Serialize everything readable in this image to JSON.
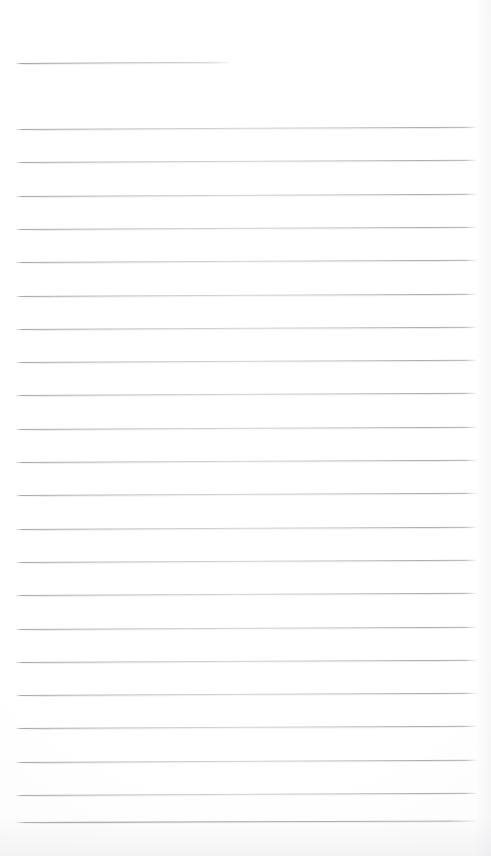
{
  "document": {
    "kind": "scanned-ruled-paper",
    "title": "",
    "page_width": 491,
    "page_height": 856,
    "background_color": "#fefefe",
    "rule_color": "#a6a6ac",
    "content_text": "",
    "notes": "Blank lined notebook page scan; no handwriting or printed text present."
  },
  "ruling": {
    "title_rule": {
      "name": "title-rule",
      "x_start": 15,
      "x_end": 231,
      "y": 63,
      "tilt_deg": -0.35,
      "thickness": 1
    },
    "body_rules_count": 22,
    "x_start": 15,
    "x_end": 478,
    "first_y": 129,
    "spacing": 33.3,
    "tilt_deg": -0.27,
    "thickness": 1,
    "body_rules": [
      {
        "index": 1,
        "y": 129,
        "tilt_deg": -0.27
      },
      {
        "index": 2,
        "y": 162.3,
        "tilt_deg": -0.27
      },
      {
        "index": 3,
        "y": 195.6,
        "tilt_deg": -0.27
      },
      {
        "index": 4,
        "y": 228.9,
        "tilt_deg": -0.27
      },
      {
        "index": 5,
        "y": 262.2,
        "tilt_deg": -0.27
      },
      {
        "index": 6,
        "y": 295.5,
        "tilt_deg": -0.27
      },
      {
        "index": 7,
        "y": 328.8,
        "tilt_deg": -0.27
      },
      {
        "index": 8,
        "y": 362.1,
        "tilt_deg": -0.27
      },
      {
        "index": 9,
        "y": 395.4,
        "tilt_deg": -0.27
      },
      {
        "index": 10,
        "y": 428.7,
        "tilt_deg": -0.27
      },
      {
        "index": 11,
        "y": 462.0,
        "tilt_deg": -0.27
      },
      {
        "index": 12,
        "y": 495.3,
        "tilt_deg": -0.27
      },
      {
        "index": 13,
        "y": 528.6,
        "tilt_deg": -0.27
      },
      {
        "index": 14,
        "y": 561.9,
        "tilt_deg": -0.27
      },
      {
        "index": 15,
        "y": 595.2,
        "tilt_deg": -0.27
      },
      {
        "index": 16,
        "y": 628.5,
        "tilt_deg": -0.27
      },
      {
        "index": 17,
        "y": 661.8,
        "tilt_deg": -0.27
      },
      {
        "index": 18,
        "y": 695.1,
        "tilt_deg": -0.27
      },
      {
        "index": 19,
        "y": 728.4,
        "tilt_deg": -0.27
      },
      {
        "index": 20,
        "y": 761.7,
        "tilt_deg": -0.27
      },
      {
        "index": 21,
        "y": 795.0,
        "tilt_deg": -0.27
      },
      {
        "index": 22,
        "y": 822.0,
        "tilt_deg": -0.18,
        "emphasis": "last-rule"
      }
    ]
  }
}
